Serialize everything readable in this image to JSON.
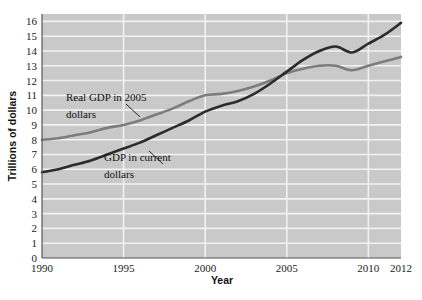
{
  "chart_data": {
    "type": "line",
    "title": "",
    "xlabel": "Year",
    "ylabel": "Trillions of dollars",
    "xlim": [
      1990,
      2012
    ],
    "ylim": [
      0,
      16.5
    ],
    "grid": true,
    "legend_position": "inline-annotations",
    "xticks": [
      "1990",
      "1995",
      "2000",
      "2005",
      "2010",
      "2012"
    ],
    "xtick_values": [
      1990,
      1995,
      2000,
      2005,
      2010,
      2012
    ],
    "yticks": [
      "0",
      "1",
      "2",
      "3",
      "4",
      "5",
      "6",
      "7",
      "8",
      "9",
      "10",
      "11",
      "12",
      "13",
      "14",
      "15",
      "16"
    ],
    "ytick_values": [
      0,
      1,
      2,
      3,
      4,
      5,
      6,
      7,
      8,
      9,
      10,
      11,
      12,
      13,
      14,
      15,
      16
    ],
    "x": [
      1990,
      1991,
      1992,
      1993,
      1994,
      1995,
      1996,
      1997,
      1998,
      1999,
      2000,
      2001,
      2002,
      2003,
      2004,
      2005,
      2006,
      2007,
      2008,
      2009,
      2010,
      2011,
      2012
    ],
    "series": [
      {
        "name": "Real GDP in 2005 dollars",
        "color": "#7d7d7d",
        "values": [
          8.0,
          8.1,
          8.3,
          8.5,
          8.8,
          9.0,
          9.3,
          9.7,
          10.1,
          10.6,
          11.0,
          11.1,
          11.3,
          11.6,
          12.0,
          12.5,
          12.8,
          13.0,
          13.0,
          12.7,
          13.0,
          13.3,
          13.6
        ]
      },
      {
        "name": "GDP in current dollars",
        "color": "#2b2b2b",
        "values": [
          5.8,
          6.0,
          6.3,
          6.6,
          7.0,
          7.4,
          7.8,
          8.3,
          8.8,
          9.3,
          9.9,
          10.3,
          10.6,
          11.1,
          11.8,
          12.6,
          13.4,
          14.0,
          14.3,
          13.9,
          14.5,
          15.1,
          15.9
        ]
      }
    ],
    "annotations": [
      {
        "name": "real-gdp-annotation",
        "text_lines": [
          "Real GDP in 2005",
          "dollars"
        ],
        "anchor_year": 1997.0,
        "anchor_value": 9.9
      },
      {
        "name": "current-gdp-annotation",
        "text_lines": [
          "GDP in current",
          "dollars"
        ],
        "anchor_year": 1996.0,
        "anchor_value": 7.6
      }
    ]
  },
  "plot_area": {
    "background_color": "#c9c9c9",
    "gridline_color": "#f2f2f2",
    "axis_color": "#555555"
  }
}
